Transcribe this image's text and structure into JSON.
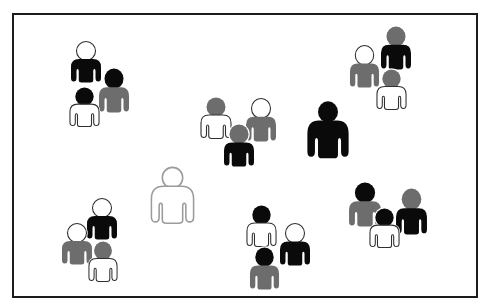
{
  "scene": {
    "description": "Clip-art style illustration of twenty person figures scattered in clusters inside a black-bordered white rectangle",
    "canvas": {
      "width": 487,
      "height": 307
    },
    "frame": {
      "x": 13,
      "y": 14,
      "width": 464,
      "height": 283,
      "border_color": "#1c1c1c",
      "border_width": 2,
      "fill": "#ffffff"
    },
    "colors": {
      "black": "#0a0a0a",
      "gray": "#6d6d6d",
      "white": "#ffffff",
      "halo": "#ffffff",
      "outline_dark": "#2f2f2f",
      "outline_light": "#9b9b9b"
    },
    "total_figures": 20,
    "figures": [
      {
        "id": "tl-1",
        "group": "top-left",
        "variant": "small",
        "x": 70,
        "y": 41,
        "w": 32,
        "h": 42,
        "head": "white",
        "body": "black",
        "outline": "#2f2f2f"
      },
      {
        "id": "tl-2",
        "group": "top-left",
        "variant": "small",
        "x": 98,
        "y": 68,
        "w": 32,
        "h": 45,
        "head": "black",
        "body": "gray",
        "outline": "#2f2f2f"
      },
      {
        "id": "tl-3",
        "group": "top-left",
        "variant": "small",
        "x": 69,
        "y": 87,
        "w": 31,
        "h": 40,
        "head": "black",
        "body": "white",
        "outline": "#2f2f2f"
      },
      {
        "id": "tr-1",
        "group": "top-right",
        "variant": "small",
        "x": 380,
        "y": 26,
        "w": 32,
        "h": 44,
        "head": "gray",
        "body": "black",
        "outline": "#2f2f2f"
      },
      {
        "id": "tr-2",
        "group": "top-right",
        "variant": "small",
        "x": 349,
        "y": 45,
        "w": 31,
        "h": 43,
        "head": "white",
        "body": "gray",
        "outline": "#2f2f2f"
      },
      {
        "id": "tr-3",
        "group": "top-right",
        "variant": "small",
        "x": 376,
        "y": 69,
        "w": 31,
        "h": 41,
        "head": "gray",
        "body": "white",
        "outline": "#2f2f2f"
      },
      {
        "id": "mid-1",
        "group": "middle",
        "variant": "small",
        "x": 200,
        "y": 97,
        "w": 32,
        "h": 42,
        "head": "gray",
        "body": "white",
        "outline": "#2f2f2f"
      },
      {
        "id": "mid-2",
        "group": "middle",
        "variant": "small",
        "x": 245,
        "y": 98,
        "w": 32,
        "h": 44,
        "head": "white",
        "body": "gray",
        "outline": "#2f2f2f"
      },
      {
        "id": "mid-3",
        "group": "middle",
        "variant": "small",
        "x": 223,
        "y": 124,
        "w": 32,
        "h": 43,
        "head": "gray",
        "body": "black",
        "outline": "#2f2f2f"
      },
      {
        "id": "big-black",
        "group": "single-large",
        "variant": "large",
        "x": 306,
        "y": 101,
        "w": 44,
        "h": 58,
        "head": "black",
        "body": "black",
        "outline": "#2f2f2f"
      },
      {
        "id": "big-white",
        "group": "single-large",
        "variant": "large",
        "x": 150,
        "y": 167,
        "w": 45,
        "h": 57,
        "head": "white",
        "body": "white",
        "outline": "#9b9b9b"
      },
      {
        "id": "bl-1",
        "group": "bottom-left",
        "variant": "small",
        "x": 86,
        "y": 198,
        "w": 32,
        "h": 42,
        "head": "white",
        "body": "black",
        "outline": "#2f2f2f"
      },
      {
        "id": "bl-2",
        "group": "bottom-left",
        "variant": "small",
        "x": 61,
        "y": 223,
        "w": 32,
        "h": 42,
        "head": "white",
        "body": "gray",
        "outline": "#2f2f2f"
      },
      {
        "id": "bl-3",
        "group": "bottom-left",
        "variant": "small",
        "x": 88,
        "y": 241,
        "w": 30,
        "h": 41,
        "head": "gray",
        "body": "white",
        "outline": "#2f2f2f"
      },
      {
        "id": "bm-1",
        "group": "bottom-middle",
        "variant": "small",
        "x": 246,
        "y": 205,
        "w": 31,
        "h": 42,
        "head": "black",
        "body": "white",
        "outline": "#2f2f2f"
      },
      {
        "id": "bm-2",
        "group": "bottom-middle",
        "variant": "small",
        "x": 279,
        "y": 223,
        "w": 32,
        "h": 43,
        "head": "white",
        "body": "black",
        "outline": "#2f2f2f"
      },
      {
        "id": "bm-3",
        "group": "bottom-middle",
        "variant": "small",
        "x": 249,
        "y": 247,
        "w": 31,
        "h": 43,
        "head": "black",
        "body": "gray",
        "outline": "#2f2f2f"
      },
      {
        "id": "br-1",
        "group": "bottom-right",
        "variant": "small",
        "x": 348,
        "y": 182,
        "w": 34,
        "h": 45,
        "head": "black",
        "body": "gray",
        "outline": "#2f2f2f"
      },
      {
        "id": "br-2",
        "group": "bottom-right",
        "variant": "small",
        "x": 395,
        "y": 188,
        "w": 33,
        "h": 47,
        "head": "gray",
        "body": "black",
        "outline": "#2f2f2f"
      },
      {
        "id": "br-3",
        "group": "bottom-right",
        "variant": "small",
        "x": 369,
        "y": 208,
        "w": 31,
        "h": 40,
        "head": "black",
        "body": "white",
        "outline": "#2f2f2f"
      }
    ]
  }
}
